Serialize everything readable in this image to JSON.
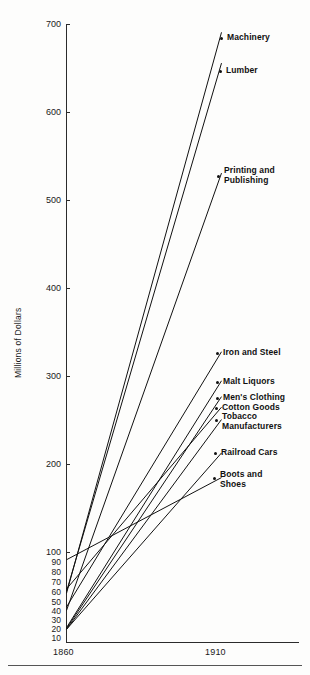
{
  "chart_data": {
    "type": "line",
    "title": "",
    "xlabel": "",
    "ylabel": "Millions of Dollars",
    "x": [
      1860,
      1910
    ],
    "xtick_labels": [
      "1860",
      "1910"
    ],
    "ylim": [
      0,
      700
    ],
    "ytick_labels_major": [
      "700",
      "600",
      "500",
      "400",
      "300",
      "200",
      "100"
    ],
    "ytick_values_major": [
      700,
      600,
      500,
      400,
      300,
      200,
      100
    ],
    "ytick_labels_minor": [
      "90",
      "80",
      "70",
      "60",
      "50",
      "40",
      "30",
      "20",
      "10"
    ],
    "ytick_values_minor": [
      90,
      80,
      70,
      60,
      50,
      40,
      30,
      20,
      10
    ],
    "grid": false,
    "legend_position": "right-inline-labels",
    "series": [
      {
        "name": "Machinery",
        "label": "Machinery",
        "values": [
          52,
          690
        ]
      },
      {
        "name": "Lumber",
        "label": "Lumber",
        "values": [
          54,
          655
        ]
      },
      {
        "name": "Printing and Publishing",
        "label": "Printing and\nPublishing",
        "values": [
          32,
          530
        ]
      },
      {
        "name": "Iron and Steel",
        "label": "Iron and Steel",
        "values": [
          36,
          327
        ]
      },
      {
        "name": "Malt Liquors",
        "label": "Malt Liquors",
        "values": [
          12,
          294
        ]
      },
      {
        "name": "Men's Clothing",
        "label": "Men's Clothing",
        "values": [
          11,
          276
        ]
      },
      {
        "name": "Cotton Goods",
        "label": "Cotton Goods",
        "values": [
          57,
          264
        ]
      },
      {
        "name": "Tobacco Manufacturers",
        "label": "Tobacco\nManufacturers",
        "values": [
          10,
          250
        ]
      },
      {
        "name": "Railroad Cars",
        "label": "Railroad Cars",
        "values": [
          10,
          212
        ]
      },
      {
        "name": "Boots and Shoes",
        "label": "Boots and\nShoes",
        "values": [
          91,
          184
        ]
      }
    ]
  },
  "axis": {
    "y_title": "Millions of Dollars",
    "x_left": "1860",
    "x_right": "1910"
  },
  "yticks": {
    "t700": "700",
    "t600": "600",
    "t500": "500",
    "t400": "400",
    "t300": "300",
    "t200": "200",
    "t100": "100",
    "t90": "90",
    "t80": "80",
    "t70": "70",
    "t60": "60",
    "t50": "50",
    "t40": "40",
    "t30": "30",
    "t20": "20",
    "t10": "10"
  },
  "labels": {
    "machinery": "Machinery",
    "lumber": "Lumber",
    "printing": "Printing and\nPublishing",
    "iron": "Iron and Steel",
    "malt": "Malt Liquors",
    "mens": "Men's Clothing",
    "cotton": "Cotton Goods",
    "tobacco": "Tobacco\nManufacturers",
    "railroad": "Railroad Cars",
    "boots": "Boots and\nShoes"
  },
  "colors": {
    "ink": "#1a1a1a",
    "line": "#111111",
    "axis": "#2b2b2b",
    "background": "#fdfdfc"
  }
}
